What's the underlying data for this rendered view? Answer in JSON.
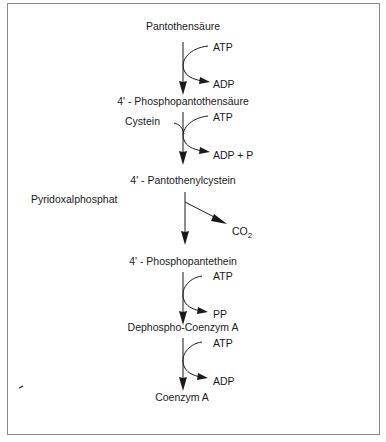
{
  "diagram": {
    "type": "metabolic-pathway",
    "title": "",
    "metabolites": [
      {
        "id": "m0",
        "label": "Pantothensäure"
      },
      {
        "id": "m1",
        "label": "4' - Phosphopantothensäure"
      },
      {
        "id": "m2",
        "label": "4' - Pantothenylcystein"
      },
      {
        "id": "m3",
        "label": "4' - Phosphopantethein"
      },
      {
        "id": "m4",
        "label": "Dephospho-Coenzym A"
      },
      {
        "id": "m5",
        "label": "Coenzym A"
      }
    ],
    "steps": [
      {
        "from": "m0",
        "to": "m1",
        "input": "ATP",
        "output": "ADP"
      },
      {
        "from": "m1",
        "to": "m2",
        "cosubstrate": "Cystein",
        "input": "ATP",
        "output": "ADP + P"
      },
      {
        "from": "m2",
        "to": "m3",
        "cofactor": "Pyridoxalphosphat",
        "output_main": "CO",
        "output_sub": "2"
      },
      {
        "from": "m3",
        "to": "m4",
        "input": "ATP",
        "output": "PP"
      },
      {
        "from": "m4",
        "to": "m5",
        "input": "ATP",
        "output": "ADP"
      }
    ]
  },
  "colors": {
    "line": "#1a1a1a",
    "frame": "#8a8a8a",
    "background": "#ffffff"
  }
}
